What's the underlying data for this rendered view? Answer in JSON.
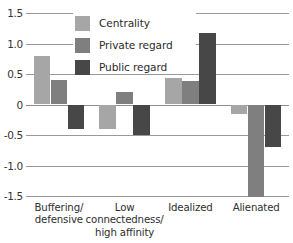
{
  "chart_data": {
    "type": "bar",
    "title": "",
    "subtitle": "",
    "xlabel": "",
    "ylabel": "",
    "grid": true,
    "legend_position": "top-center",
    "ylim": [
      -1.5,
      1.5
    ],
    "yticks": [
      "1.5",
      "1.0",
      "0.5",
      "0",
      "-0.5",
      "-1.0",
      "-1.5"
    ],
    "ytick_values": [
      1.5,
      1.0,
      0.5,
      0,
      -0.5,
      -1.0,
      -1.5
    ],
    "categories": [
      "Buffering/ defensive",
      "Low connectedness/ high affinity",
      "Idealized",
      "Alienated"
    ],
    "category_lines": [
      [
        "Buffering/",
        "defensive"
      ],
      [
        "Low",
        "connectedness/",
        "high affinity"
      ],
      [
        "Idealized"
      ],
      [
        "Alienated"
      ]
    ],
    "series": [
      {
        "name": "Centrality",
        "color": "#a6a6a6",
        "values": [
          0.8,
          -0.4,
          0.44,
          -0.15
        ]
      },
      {
        "name": "Private regard",
        "color": "#7f7f7f",
        "values": [
          0.4,
          0.2,
          0.39,
          -1.55
        ]
      },
      {
        "name": "Public regard",
        "color": "#474747",
        "values": [
          -0.4,
          -0.5,
          1.18,
          -0.7
        ]
      }
    ]
  },
  "legend": {
    "items": [
      {
        "label": "Centrality"
      },
      {
        "label": "Private regard"
      },
      {
        "label": "Public regard"
      }
    ]
  },
  "axis": {
    "y_labels": [
      "1.5",
      "1.0",
      "0.5",
      "0",
      "-0.5",
      "-1.0",
      "-1.5"
    ]
  }
}
